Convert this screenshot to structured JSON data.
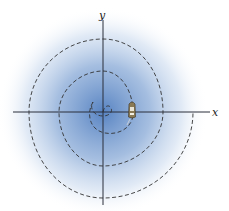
{
  "figure": {
    "axes": {
      "x_label": "x",
      "y_label": "y",
      "color": "#2b2f3a"
    },
    "background": {
      "glow_center_color": "#5b86c4",
      "glow_edge_color": "#ffffff"
    },
    "spiral": {
      "style": "dashed",
      "color": "#333333",
      "type": "archimedean spiral, counterclockwise outward from origin"
    },
    "boat": {
      "description": "small boat on the spiral near the positive x-axis",
      "hull_color": "#8a7a55",
      "cabin_color": "#e8e4d6"
    }
  }
}
